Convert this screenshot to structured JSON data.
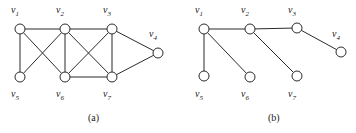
{
  "figure": {
    "width": 356,
    "height": 133,
    "background": "#ffffff",
    "stroke_color": "#2b2b2b",
    "node_fill": "#ffffff",
    "text_color": "#1a1a1a",
    "node_radius": 5
  },
  "panels": [
    {
      "id": "panel-a",
      "caption": "(a)",
      "caption_pos": {
        "x": 88,
        "y": 112
      },
      "vertices": [
        {
          "id": "v1",
          "label": "v",
          "sub": "1",
          "x": 20,
          "y": 29,
          "label_x": 11,
          "label_y": 5
        },
        {
          "id": "v2",
          "label": "v",
          "sub": "2",
          "x": 65,
          "y": 29,
          "label_x": 56,
          "label_y": 5
        },
        {
          "id": "v3",
          "label": "v",
          "sub": "3",
          "x": 112,
          "y": 29,
          "label_x": 103,
          "label_y": 5
        },
        {
          "id": "v4",
          "label": "v",
          "sub": "4",
          "x": 158,
          "y": 53,
          "label_x": 149,
          "label_y": 29
        },
        {
          "id": "v5",
          "label": "v",
          "sub": "5",
          "x": 20,
          "y": 77,
          "label_x": 11,
          "label_y": 89
        },
        {
          "id": "v6",
          "label": "v",
          "sub": "6",
          "x": 65,
          "y": 77,
          "label_x": 56,
          "label_y": 89
        },
        {
          "id": "v7",
          "label": "v",
          "sub": "7",
          "x": 112,
          "y": 77,
          "label_x": 103,
          "label_y": 89
        }
      ],
      "edges": [
        [
          "v1",
          "v2"
        ],
        [
          "v2",
          "v3"
        ],
        [
          "v1",
          "v5"
        ],
        [
          "v1",
          "v6"
        ],
        [
          "v2",
          "v5"
        ],
        [
          "v2",
          "v6"
        ],
        [
          "v2",
          "v7"
        ],
        [
          "v3",
          "v6"
        ],
        [
          "v3",
          "v7"
        ],
        [
          "v3",
          "v4"
        ],
        [
          "v4",
          "v7"
        ],
        [
          "v6",
          "v7"
        ]
      ]
    },
    {
      "id": "panel-b",
      "caption": "(b)",
      "caption_pos": {
        "x": 268,
        "y": 112
      },
      "vertices": [
        {
          "id": "v1",
          "label": "v",
          "sub": "1",
          "x": 204,
          "y": 29,
          "label_x": 195,
          "label_y": 5
        },
        {
          "id": "v2",
          "label": "v",
          "sub": "2",
          "x": 250,
          "y": 29,
          "label_x": 241,
          "label_y": 5
        },
        {
          "id": "v3",
          "label": "v",
          "sub": "3",
          "x": 297,
          "y": 28,
          "label_x": 288,
          "label_y": 5
        },
        {
          "id": "v4",
          "label": "v",
          "sub": "4",
          "x": 341,
          "y": 52,
          "label_x": 332,
          "label_y": 29
        },
        {
          "id": "v5",
          "label": "v",
          "sub": "5",
          "x": 204,
          "y": 76,
          "label_x": 195,
          "label_y": 89
        },
        {
          "id": "v6",
          "label": "v",
          "sub": "6",
          "x": 250,
          "y": 77,
          "label_x": 241,
          "label_y": 89
        },
        {
          "id": "v7",
          "label": "v",
          "sub": "7",
          "x": 297,
          "y": 76,
          "label_x": 288,
          "label_y": 89
        }
      ],
      "edges": [
        [
          "v1",
          "v2"
        ],
        [
          "v2",
          "v3"
        ],
        [
          "v3",
          "v4"
        ],
        [
          "v1",
          "v5"
        ],
        [
          "v1",
          "v6"
        ],
        [
          "v2",
          "v7"
        ]
      ]
    }
  ]
}
